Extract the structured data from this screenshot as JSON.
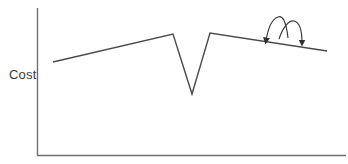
{
  "diagram": {
    "type": "cost-landscape",
    "y_axis_label": "Cost",
    "x_axis_label": "",
    "colors": {
      "axis": "#6e6e6e",
      "curve": "#4a4a4a",
      "arrow": "#3a3a3a",
      "background": "#ffffff"
    },
    "curve_points": [
      {
        "x": 53,
        "y": 62,
        "label": "start"
      },
      {
        "x": 173,
        "y": 34,
        "label": "local-peak-left"
      },
      {
        "x": 192,
        "y": 94,
        "label": "global-minimum"
      },
      {
        "x": 210,
        "y": 33,
        "label": "local-peak-right"
      },
      {
        "x": 327,
        "y": 51,
        "label": "end"
      }
    ],
    "annotations": [
      {
        "kind": "curved-arrow",
        "direction": "left",
        "description": "hop left along plateau"
      },
      {
        "kind": "curved-arrow",
        "direction": "right",
        "description": "hop right along plateau"
      }
    ]
  }
}
